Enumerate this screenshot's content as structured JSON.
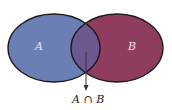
{
  "diagram": {
    "type": "venn",
    "sets": [
      {
        "label": "A",
        "color": "#6b7fb5"
      },
      {
        "label": "B",
        "color": "#8e3d5e"
      }
    ],
    "intersection": {
      "label": "A ∩ B",
      "color": "#6e5890"
    },
    "outline_color": "#1a1a1a",
    "label_color": "#e8e6f0"
  }
}
